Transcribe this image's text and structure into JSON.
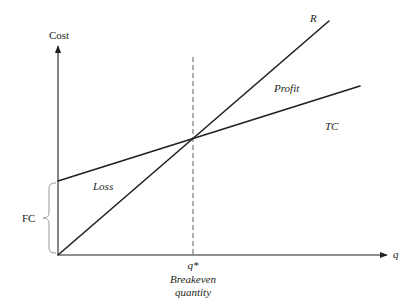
{
  "diagram": {
    "y_axis": {
      "label": "Cost"
    },
    "x_axis": {
      "label": "q"
    },
    "lines": {
      "revenue": {
        "label": "R"
      },
      "total_cost": {
        "label": "TC"
      }
    },
    "regions": {
      "profit": "Profit",
      "loss": "Loss"
    },
    "fixed_cost": {
      "label": "FC"
    },
    "breakeven": {
      "symbol": "q*",
      "caption_line1": "Breakeven",
      "caption_line2": "quantity"
    },
    "colors": {
      "ink": "#231f20",
      "dashed": "#4a4a4a",
      "brace": "#8a8a8a",
      "background": "#ffffff"
    }
  }
}
